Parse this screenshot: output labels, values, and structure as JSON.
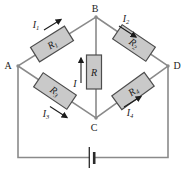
{
  "diagram": {
    "kind": "wheatstone-bridge-circuit",
    "nodes": {
      "a": {
        "label": "A"
      },
      "b": {
        "label": "B"
      },
      "c": {
        "label": "C"
      },
      "d": {
        "label": "D"
      }
    },
    "resistors": {
      "r1": {
        "symbol": "R",
        "sub": "1"
      },
      "r2": {
        "symbol": "R",
        "sub": "2"
      },
      "r3": {
        "symbol": "R",
        "sub": "3"
      },
      "r4": {
        "symbol": "R",
        "sub": "4"
      },
      "r_mid": {
        "symbol": "R",
        "sub": ""
      }
    },
    "currents": {
      "i1": {
        "symbol": "I",
        "sub": "1"
      },
      "i2": {
        "symbol": "I",
        "sub": "2"
      },
      "i3": {
        "symbol": "I",
        "sub": "3"
      },
      "i4": {
        "symbol": "I",
        "sub": "4"
      },
      "i_mid": {
        "symbol": "I",
        "sub": ""
      }
    },
    "battery": {
      "icon": "battery-cell-icon"
    },
    "colors": {
      "background": "#ffffff",
      "wire": "#8a8a8a",
      "resistor_fill": "#c9c9c9",
      "resistor_stroke": "#4d4d4d",
      "battery": "#2a2a2a",
      "arrow": "#1c1c1c",
      "text": "#1c1c1c"
    }
  }
}
